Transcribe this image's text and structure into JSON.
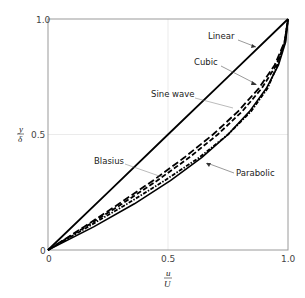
{
  "chart_data": {
    "type": "line",
    "title": "",
    "xlabel": "u/U",
    "ylabel": "y/δ",
    "xlim": [
      0,
      1.0
    ],
    "ylim": [
      0,
      1.0
    ],
    "grid": true,
    "legend": "inline annotations with leader arrows",
    "x_ticks": [
      "0",
      "0.5",
      "1.0"
    ],
    "y_ticks": [
      "0",
      "0.5",
      "1.0"
    ],
    "series": [
      {
        "name": "Linear",
        "style": "solid",
        "eta": [
          0,
          0.25,
          0.5,
          0.75,
          1.0
        ],
        "u_over_U": [
          0,
          0.25,
          0.5,
          0.75,
          1.0
        ]
      },
      {
        "name": "Cubic",
        "style": "long-dash",
        "eta": [
          0,
          0.1,
          0.2,
          0.3,
          0.4,
          0.5,
          0.6,
          0.7,
          0.8,
          0.9,
          1.0
        ],
        "u_over_U": [
          0,
          0.1495,
          0.296,
          0.4365,
          0.568,
          0.6875,
          0.792,
          0.8785,
          0.944,
          0.9855,
          1.0
        ]
      },
      {
        "name": "Sine wave",
        "style": "dash",
        "eta": [
          0,
          0.1,
          0.2,
          0.3,
          0.4,
          0.5,
          0.6,
          0.7,
          0.8,
          0.9,
          1.0
        ],
        "u_over_U": [
          0,
          0.156,
          0.309,
          0.454,
          0.588,
          0.707,
          0.809,
          0.891,
          0.951,
          0.988,
          1.0
        ]
      },
      {
        "name": "Blasius",
        "style": "dash-dot",
        "eta": [
          0,
          0.1,
          0.2,
          0.3,
          0.4,
          0.5,
          0.6,
          0.7,
          0.8,
          0.9,
          1.0
        ],
        "u_over_U": [
          0,
          0.166,
          0.33,
          0.485,
          0.63,
          0.75,
          0.846,
          0.915,
          0.956,
          0.986,
          1.0
        ]
      },
      {
        "name": "Parabolic",
        "style": "solid-thick",
        "eta": [
          0,
          0.1,
          0.2,
          0.3,
          0.4,
          0.5,
          0.6,
          0.7,
          0.8,
          0.9,
          1.0
        ],
        "u_over_U": [
          0,
          0.19,
          0.36,
          0.51,
          0.64,
          0.75,
          0.84,
          0.91,
          0.96,
          0.99,
          1.0
        ]
      }
    ]
  },
  "axes": {
    "x_ticks": [
      "0",
      "0.5",
      "1.0"
    ],
    "y_ticks": [
      "0",
      "0.5",
      "1.0"
    ],
    "xlabel_num": "u",
    "xlabel_den": "U",
    "ylabel_num": "y",
    "ylabel_den": "δ"
  },
  "annotations": {
    "linear": "Linear",
    "cubic": "Cubic",
    "sine": "Sine wave",
    "blasius": "Blasius",
    "parabolic": "Parabolic"
  }
}
